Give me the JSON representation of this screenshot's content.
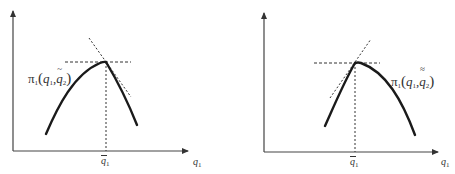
{
  "figure": {
    "panels": [
      {
        "id": "left",
        "curve_label": {
          "pi": "π",
          "pi_sub": "1",
          "open": "(",
          "q1": "q",
          "q1_sub": "1",
          "comma": ",",
          "q2": "q",
          "q2_sub": "2",
          "q2_accent": "~",
          "close": ")"
        },
        "x_marker": {
          "q": "q",
          "sub": "1"
        },
        "x_axis_label": {
          "q": "q",
          "sub": "1"
        },
        "tangent_slope": "negative",
        "kink": "peak of profit curve with left tangent horizontal and steep negative dashed tangent"
      },
      {
        "id": "right",
        "curve_label": {
          "pi": "π",
          "pi_sub": "1",
          "open": "(",
          "q1": "q",
          "q1_sub": "1",
          "comma": ",",
          "q2": "q",
          "q2_sub": "2",
          "q2_accent": "≈",
          "close": ")"
        },
        "x_marker": {
          "q": "q",
          "sub": "1"
        },
        "x_axis_label": {
          "q": "q",
          "sub": "1"
        },
        "tangent_slope": "positive",
        "kink": "peak of profit curve with horizontal right tangent and steep positive dashed tangent"
      }
    ],
    "colors": {
      "curve": "#1a1a1a",
      "axes": "#333333",
      "dashed": "#333333",
      "background": "#ffffff"
    }
  }
}
